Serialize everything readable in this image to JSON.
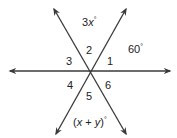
{
  "diagram": {
    "type": "intersecting-lines",
    "intersection": {
      "x": 89,
      "y": 71
    },
    "line_color": "#3a3a3a",
    "lines": [
      {
        "name": "horizontal-line",
        "x1": 10,
        "y1": 71,
        "x2": 170,
        "y2": 71
      },
      {
        "name": "line-upper-left-to-lower-right",
        "x1": 54,
        "y1": 9,
        "x2": 126,
        "y2": 134
      },
      {
        "name": "line-upper-right-to-lower-left",
        "x1": 126,
        "y1": 9,
        "x2": 56,
        "y2": 134
      }
    ],
    "angle_labels": {
      "a1": "1",
      "a2": "2",
      "a3": "3",
      "a4": "4",
      "a5": "5",
      "a6": "6"
    },
    "measure_labels": {
      "top_coef": "3",
      "top_var": "x",
      "top_deg": "°",
      "right_value": "60",
      "right_deg": "°",
      "bottom_open": "(",
      "bottom_x": "x",
      "bottom_plus": " + ",
      "bottom_y": "y",
      "bottom_close": ")",
      "bottom_deg": "°"
    }
  }
}
